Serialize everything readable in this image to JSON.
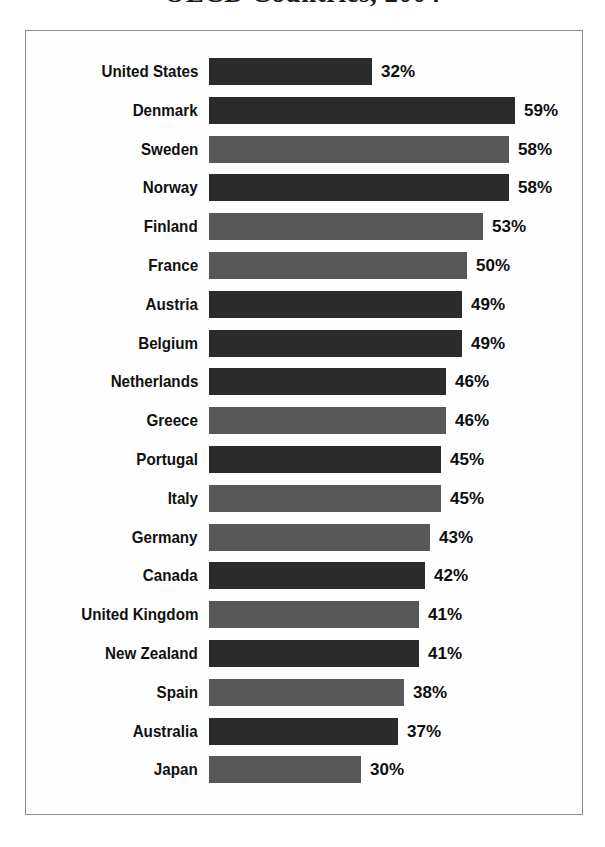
{
  "title": "OECD Countries, 2004",
  "chart_data": {
    "type": "bar",
    "orientation": "horizontal",
    "title": "OECD Countries, 2004",
    "xlabel": "",
    "ylabel": "",
    "grid": false,
    "legend": null,
    "value_suffix": "%",
    "xlim": [
      0,
      62
    ],
    "categories": [
      "United States",
      "Denmark",
      "Sweden",
      "Norway",
      "Finland",
      "France",
      "Austria",
      "Belgium",
      "Netherlands",
      "Greece",
      "Portugal",
      "Italy",
      "Germany",
      "Canada",
      "United Kingdom",
      "New Zealand",
      "Spain",
      "Australia",
      "Japan"
    ],
    "values": [
      32,
      59,
      58,
      58,
      53,
      50,
      49,
      49,
      46,
      46,
      45,
      45,
      43,
      42,
      41,
      41,
      38,
      37,
      30
    ],
    "value_labels": [
      "32%",
      "59%",
      "58%",
      "58%",
      "53%",
      "50%",
      "49%",
      "49%",
      "46%",
      "46%",
      "45%",
      "45%",
      "43%",
      "42%",
      "41%",
      "41%",
      "38%",
      "37%",
      "30%"
    ],
    "bar_shades": [
      "dark",
      "dark",
      "mid",
      "dark",
      "mid",
      "mid",
      "dark",
      "dark",
      "dark",
      "mid",
      "dark",
      "mid",
      "mid",
      "dark",
      "mid",
      "dark",
      "mid",
      "dark",
      "mid"
    ]
  },
  "colors": {
    "bar_dark": "#2b2b2b",
    "bar_mid": "#585858",
    "frame_border": "#8d8d8d",
    "background": "#ffffff",
    "text": "#101010"
  }
}
